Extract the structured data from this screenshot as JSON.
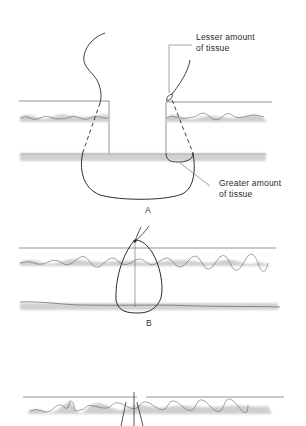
{
  "panels": [
    {
      "id": "A",
      "letter": "A",
      "annotations": [
        {
          "line1": "Lesser amount",
          "line2": "of tissue"
        },
        {
          "line1": "Greater amount",
          "line2": "of tissue"
        }
      ]
    },
    {
      "id": "B",
      "letter": "B"
    },
    {
      "id": "C",
      "letter": ""
    }
  ],
  "colors": {
    "ink": "#2b2b2b",
    "thin_line": "#555555",
    "tissue_shade": "#c8c8c8",
    "background": "#ffffff"
  }
}
